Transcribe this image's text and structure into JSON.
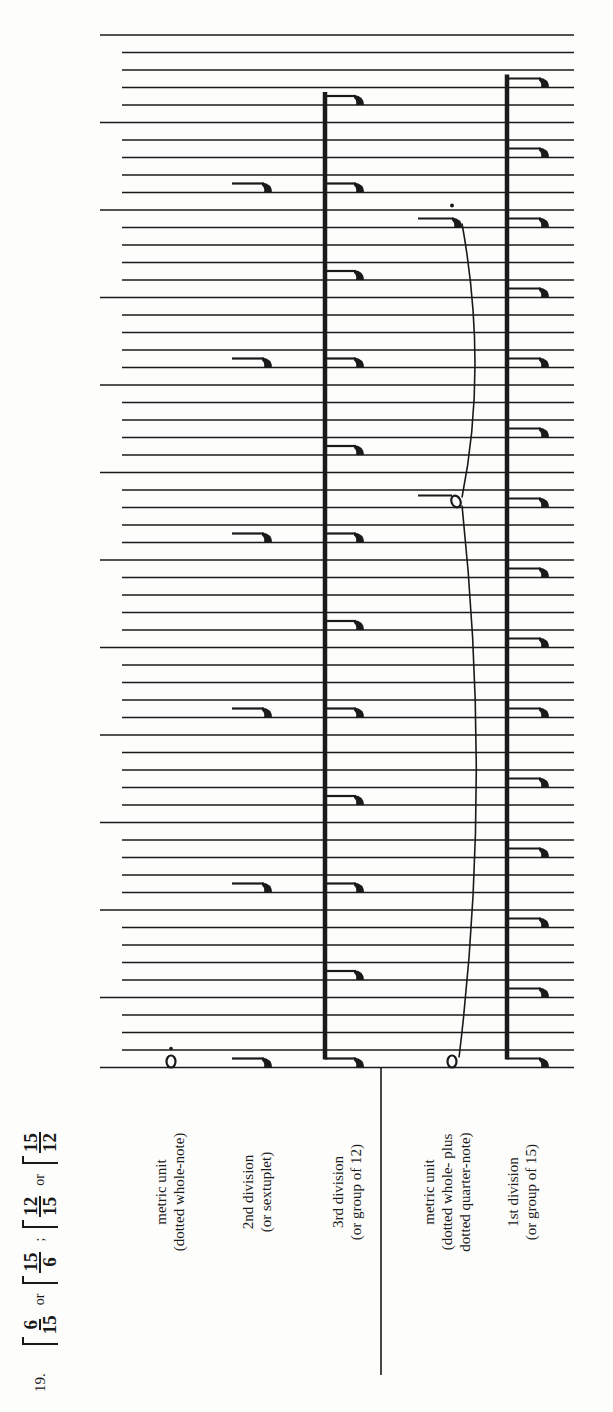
{
  "exercise": {
    "number": "19.",
    "meters": [
      {
        "top": "6",
        "bottom": "15"
      },
      {
        "sep": "or"
      },
      {
        "top": "15",
        "bottom": "6"
      },
      {
        "sep": ";"
      },
      {
        "top": "12",
        "bottom": "15"
      },
      {
        "sep": "or"
      },
      {
        "top": "15",
        "bottom": "12"
      }
    ]
  },
  "labels": {
    "metric_unit_1": {
      "line1": "metric unit",
      "line2": "(dotted whole-note)"
    },
    "second_division": {
      "line1": "2nd division",
      "line2": "(or sextuplet)"
    },
    "third_division": {
      "line1": "3rd division",
      "line2": "(or group of 12)"
    },
    "metric_unit_2": {
      "line1": "metric unit",
      "line2": "(dotted whole- plus",
      "line3": "dotted quarter-note)"
    },
    "first_division": {
      "line1": "1st division",
      "line2": "(or group of 15)"
    }
  },
  "grid": {
    "line_count": 60,
    "first_y": 35,
    "spacing": 17.5,
    "long_line_every": 5,
    "x_start_short": 122,
    "x_start_long": 100,
    "x_end": 574
  },
  "colors": {
    "ink": "#1a1a1a",
    "paper": "#fdfdfc"
  }
}
